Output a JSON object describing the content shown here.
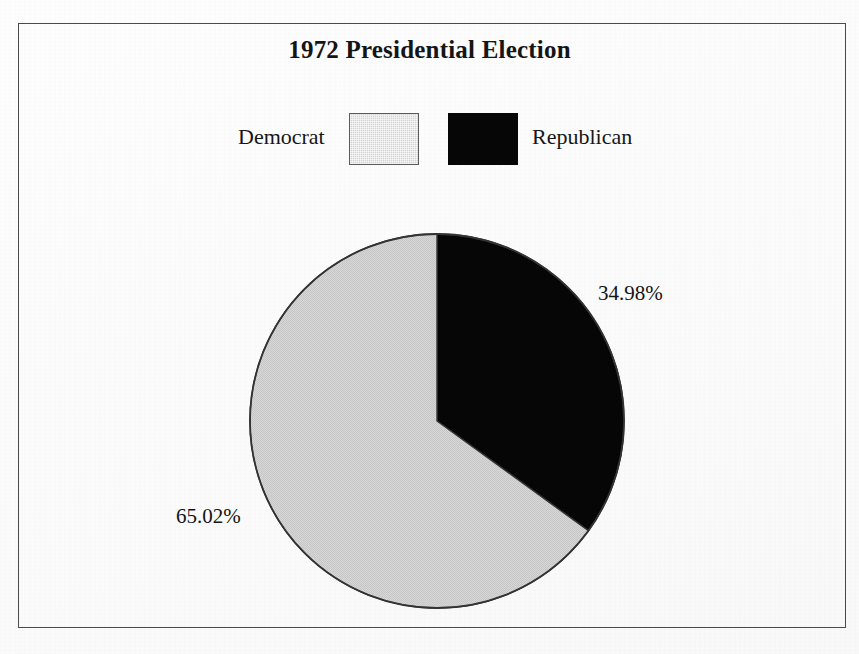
{
  "chart_data": {
    "type": "pie",
    "title": "1972 Presidential Election",
    "categories": [
      "Democrat",
      "Republican"
    ],
    "values": [
      65.02,
      34.98
    ],
    "value_labels": [
      "65.02%",
      "34.98%"
    ],
    "colors": [
      "#d4d4d4",
      "#060606"
    ],
    "start_angle_deg": 0,
    "direction": "clockwise",
    "legend_position": "top",
    "grid": false,
    "xlabel": "",
    "ylabel": "",
    "slices": [
      {
        "name": "Democrat",
        "value": 65.02,
        "label": "65.02%",
        "color": "#d4d4d4",
        "sweep_deg": 234.07
      },
      {
        "name": "Republican",
        "value": 34.98,
        "label": "34.98%",
        "color": "#060606",
        "sweep_deg": 125.93
      }
    ]
  },
  "page": {
    "title": "1972 Presidential Election",
    "background_color": "#fefefe",
    "border_color": "#4a4a4a"
  },
  "legend": {
    "items": [
      {
        "label": "Democrat",
        "swatch_color": "#d4d4d4"
      },
      {
        "label": "Republican",
        "swatch_color": "#060606"
      }
    ]
  },
  "labels": {
    "republican_pct": "34.98%",
    "democrat_pct": "65.02%"
  }
}
